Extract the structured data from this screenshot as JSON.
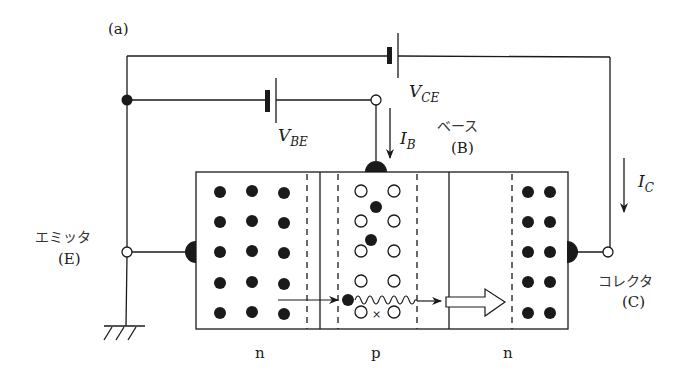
{
  "figure": {
    "panel_label": "(a)",
    "colors": {
      "ink": "#1a1a1a",
      "background": "#ffffff"
    }
  },
  "batteries": {
    "vce": {
      "symbol": "V",
      "subscript": "CE"
    },
    "vbe": {
      "symbol": "V",
      "subscript": "BE"
    }
  },
  "currents": {
    "ib": {
      "symbol": "I",
      "subscript": "B"
    },
    "ic": {
      "symbol": "I",
      "subscript": "C"
    }
  },
  "terminals": {
    "emitter": {
      "name_jp": "エミッタ",
      "abbr": "(E)"
    },
    "base": {
      "name_jp": "ベース",
      "abbr": "(B)"
    },
    "collector": {
      "name_jp": "コレクタ",
      "abbr": "(C)"
    }
  },
  "regions": [
    {
      "type": "n",
      "label": "n"
    },
    {
      "type": "p",
      "label": "p"
    },
    {
      "type": "n",
      "label": "n"
    }
  ],
  "carriers": {
    "emitter_electrons": {
      "cols": 3,
      "rows": 5,
      "kind": "electron"
    },
    "base_holes": {
      "cols": 2,
      "rows": 5,
      "kind": "hole"
    },
    "base_injected_electrons": 3,
    "collector_electrons": {
      "cols": 2,
      "rows": 5,
      "kind": "electron"
    },
    "recombination_mark": "×"
  }
}
